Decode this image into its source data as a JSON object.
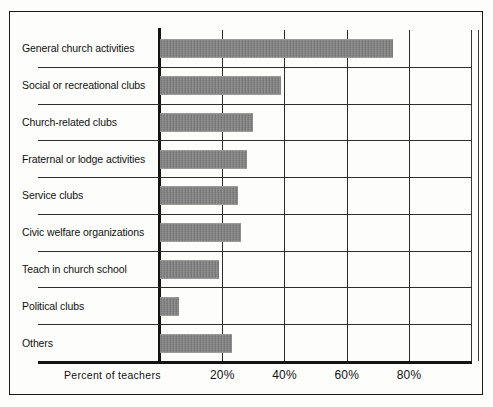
{
  "chart_data": {
    "type": "bar",
    "orientation": "horizontal",
    "title": "",
    "subtitle": "",
    "xlabel": "Percent of teachers",
    "ylabel": "",
    "xlim": [
      0,
      100
    ],
    "grid": true,
    "legend": "none",
    "xticks": [
      20,
      40,
      60,
      80
    ],
    "xtick_labels": [
      "20%",
      "40%",
      "60%",
      "80%"
    ],
    "categories": [
      "General church activities",
      "Social or recreational clubs",
      "Church-related clubs",
      "Fraternal or lodge activities",
      "Service clubs",
      "Civic welfare organizations",
      "Teach in church school",
      "Political clubs",
      "Others"
    ],
    "values": [
      75,
      39,
      30,
      28,
      25,
      26,
      19,
      6,
      23
    ],
    "bar_color": "#b5b5b5",
    "axis_color": "#141414",
    "grid_color": "#2e2e2e",
    "background_color": "#fdfdfb"
  },
  "axis": {
    "caption": "Percent of teachers"
  }
}
